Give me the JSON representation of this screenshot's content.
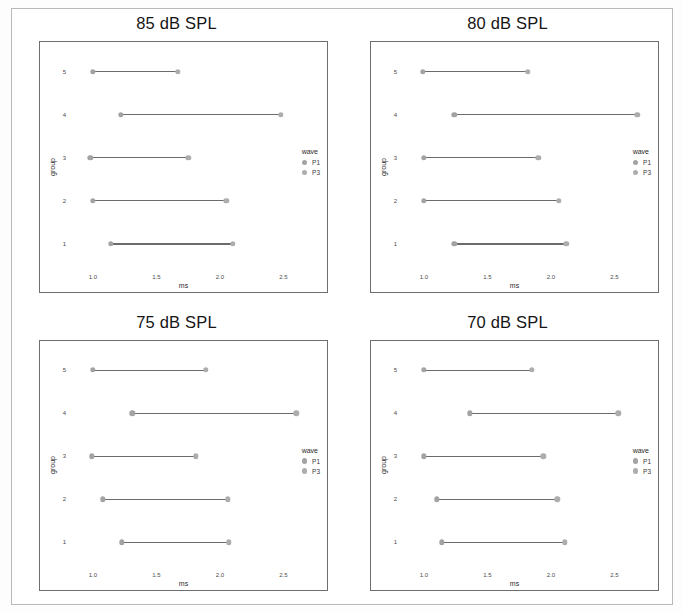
{
  "figure": {
    "background": "#ffffff",
    "panel_border_color": "#6e6e6e",
    "marker_color": "#a0a0a0",
    "line_color": "#6b6b6b"
  },
  "legend": {
    "title": "wave",
    "items": [
      {
        "label": "P1",
        "color": "#a3a3a3"
      },
      {
        "label": "P3",
        "color": "#adadad"
      }
    ]
  },
  "axes": {
    "xlabel": "ms",
    "ylabel": "group",
    "xticks": [
      "1.0",
      "1.5",
      "2.0",
      "2.5"
    ],
    "xtick_values": [
      1.0,
      1.5,
      2.0,
      2.5
    ],
    "yticks": [
      "5",
      "4",
      "3",
      "2",
      "1"
    ],
    "xlim": [
      0.82,
      2.78
    ],
    "ylim": [
      0.5,
      5.5
    ]
  },
  "chart_data": [
    {
      "type": "scatter",
      "title": "85 dB SPL",
      "xlabel": "ms",
      "ylabel": "group",
      "xlim": [
        0.82,
        2.78
      ],
      "grid": false,
      "legend_position": "right",
      "categories": [
        "5",
        "4",
        "3",
        "2",
        "1"
      ],
      "series": [
        {
          "name": "P1",
          "values": [
            1.0,
            1.22,
            0.98,
            1.0,
            1.14
          ]
        },
        {
          "name": "P3",
          "values": [
            1.67,
            2.48,
            1.75,
            2.05,
            2.1
          ]
        }
      ]
    },
    {
      "type": "scatter",
      "title": "80 dB SPL",
      "xlabel": "ms",
      "ylabel": "group",
      "xlim": [
        0.82,
        2.78
      ],
      "grid": false,
      "legend_position": "right",
      "categories": [
        "5",
        "4",
        "3",
        "2",
        "1"
      ],
      "series": [
        {
          "name": "P1",
          "values": [
            0.99,
            1.24,
            1.0,
            1.0,
            1.24
          ]
        },
        {
          "name": "P3",
          "values": [
            1.82,
            2.68,
            1.9,
            2.06,
            2.12
          ]
        }
      ]
    },
    {
      "type": "scatter",
      "title": "75 dB SPL",
      "xlabel": "ms",
      "ylabel": "group",
      "xlim": [
        0.82,
        2.78
      ],
      "grid": false,
      "legend_position": "right",
      "categories": [
        "5",
        "4",
        "3",
        "2",
        "1"
      ],
      "series": [
        {
          "name": "P1",
          "values": [
            1.0,
            1.31,
            0.99,
            1.08,
            1.23
          ]
        },
        {
          "name": "P3",
          "values": [
            1.89,
            2.6,
            1.81,
            2.06,
            2.07
          ]
        }
      ]
    },
    {
      "type": "scatter",
      "title": "70 dB SPL",
      "xlabel": "ms",
      "ylabel": "group",
      "xlim": [
        0.82,
        2.78
      ],
      "grid": false,
      "legend_position": "right",
      "categories": [
        "5",
        "4",
        "3",
        "2",
        "1"
      ],
      "series": [
        {
          "name": "P1",
          "values": [
            1.0,
            1.36,
            1.0,
            1.1,
            1.14
          ]
        },
        {
          "name": "P3",
          "values": [
            1.85,
            2.53,
            1.94,
            2.05,
            2.11
          ]
        }
      ]
    }
  ]
}
